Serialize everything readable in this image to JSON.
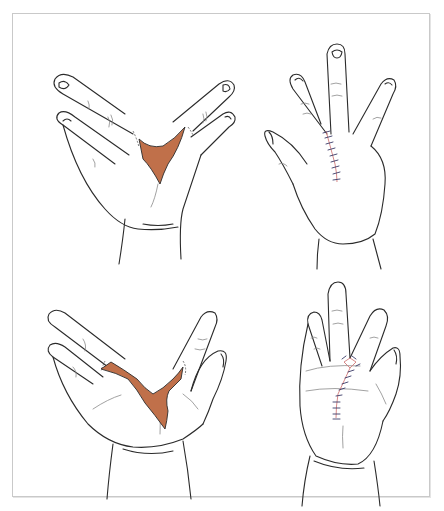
{
  "figure": {
    "panels": [
      {
        "id": "top-left",
        "label": "Dorsal view, cleft hand with skin defect between fingers",
        "view": "dorsal",
        "state": "cleft-with-defect"
      },
      {
        "id": "top-right",
        "label": "Dorsal view after cleft closure with sutures",
        "view": "dorsal",
        "state": "sutured"
      },
      {
        "id": "bottom-left",
        "label": "Palmar view, cleft hand with skin defect between fingers",
        "view": "palmar",
        "state": "cleft-with-defect"
      },
      {
        "id": "bottom-right",
        "label": "Palmar view after cleft closure with sutures",
        "view": "palmar",
        "state": "sutured"
      }
    ],
    "colors": {
      "defect_fill": "#c0704a",
      "line_ink": "#2b2b2b",
      "suture_line": "#d27a7a",
      "suture_stitch": "#3a3a66",
      "frame_border": "#c9c9c9",
      "background": "#ffffff"
    }
  }
}
